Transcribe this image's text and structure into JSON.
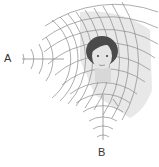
{
  "diagram": {
    "type": "wave-interference",
    "sources": [
      {
        "label": "A",
        "position": "left"
      },
      {
        "label": "B",
        "position": "bottom"
      }
    ],
    "listener": "face",
    "colors": {
      "wave": "#8a8a8a",
      "shade": "#e6e6e6",
      "hair": "#4a4a4a",
      "skin": "#dcdcdc",
      "label": "#333333"
    }
  }
}
